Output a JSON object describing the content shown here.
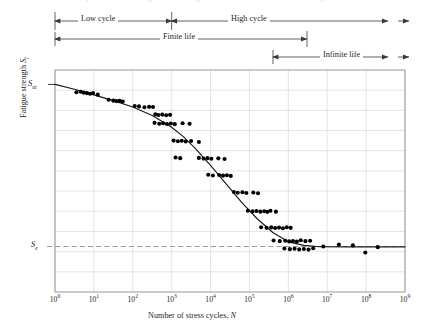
{
  "figure": {
    "kind": "s-n-fatigue-diagram",
    "background": "#ffffff",
    "ink": "#231f20",
    "grid_color": "#d7d9dc",
    "frame_color": "#8a8d91",
    "curve_color": "#1a1a1a",
    "point_color": "#000000",
    "dashed_color": "#9a9ca0"
  },
  "annotations": {
    "low_cycle": "Low cycle",
    "high_cycle": "High cycle",
    "finite_life": "Finite life",
    "infinite_life": "Infinite life"
  },
  "axes": {
    "x_title_prefix": "Number of stress cycles, ",
    "x_title_symbol": "N",
    "y_title_prefix": "Fatigue strength ",
    "y_title_symbol": "S",
    "y_title_sub": "f",
    "x_ticks": [
      "0",
      "1",
      "2",
      "3",
      "4",
      "5",
      "6",
      "7",
      "8",
      "9"
    ],
    "x_tick_mantissa": "10",
    "y_markers": [
      {
        "symbol": "S",
        "sub": "ut",
        "name": "ultimate-tensile-strength"
      },
      {
        "symbol": "S",
        "sub": "e",
        "name": "endurance-limit"
      }
    ]
  },
  "chart_data": {
    "type": "scatter",
    "title": "",
    "xlabel": "Number of stress cycles, N",
    "ylabel": "Fatigue strength S_f",
    "x_scale": "log10",
    "xlim": [
      0,
      9
    ],
    "ylim": [
      0,
      1
    ],
    "grid": true,
    "legend": null,
    "y_reference_lines": [
      {
        "label": "S_ut",
        "value": 0.935,
        "style": "solid-tick"
      },
      {
        "label": "S_e",
        "value": 0.205,
        "style": "dashed"
      }
    ],
    "region_brackets": [
      {
        "label": "Low cycle",
        "x_from": 0,
        "x_to": 3,
        "row": 0
      },
      {
        "label": "High cycle",
        "x_from": 3,
        "x_to": 9,
        "row": 0,
        "open_end": true
      },
      {
        "label": "Finite life",
        "x_from": 0,
        "x_to": 6.5,
        "row": 1
      },
      {
        "label": "Infinite life",
        "x_from": 5.6,
        "x_to": 9,
        "row": 2,
        "open_end": true
      }
    ],
    "fit_curve": [
      [
        0.0,
        0.935
      ],
      [
        0.5,
        0.913
      ],
      [
        1.0,
        0.888
      ],
      [
        1.5,
        0.862
      ],
      [
        2.0,
        0.833
      ],
      [
        2.5,
        0.795
      ],
      [
        3.0,
        0.742
      ],
      [
        3.3,
        0.7
      ],
      [
        3.6,
        0.648
      ],
      [
        4.0,
        0.57
      ],
      [
        4.4,
        0.487
      ],
      [
        4.8,
        0.404
      ],
      [
        5.2,
        0.33
      ],
      [
        5.6,
        0.268
      ],
      [
        6.0,
        0.226
      ],
      [
        6.4,
        0.21
      ],
      [
        6.8,
        0.204
      ],
      [
        7.5,
        0.203
      ],
      [
        8.2,
        0.203
      ],
      [
        9.0,
        0.203
      ]
    ],
    "points": [
      [
        0.55,
        0.9
      ],
      [
        0.66,
        0.902
      ],
      [
        0.74,
        0.898
      ],
      [
        0.82,
        0.896
      ],
      [
        0.9,
        0.893
      ],
      [
        0.98,
        0.896
      ],
      [
        1.1,
        0.889
      ],
      [
        1.38,
        0.866
      ],
      [
        1.5,
        0.862
      ],
      [
        1.58,
        0.86
      ],
      [
        1.66,
        0.861
      ],
      [
        1.74,
        0.858
      ],
      [
        2.05,
        0.838
      ],
      [
        2.16,
        0.836
      ],
      [
        2.3,
        0.832
      ],
      [
        2.42,
        0.834
      ],
      [
        2.52,
        0.833
      ],
      [
        2.58,
        0.8
      ],
      [
        2.66,
        0.797
      ],
      [
        2.76,
        0.799
      ],
      [
        2.86,
        0.796
      ],
      [
        2.96,
        0.798
      ],
      [
        2.56,
        0.762
      ],
      [
        2.68,
        0.758
      ],
      [
        2.78,
        0.76
      ],
      [
        2.88,
        0.757
      ],
      [
        2.98,
        0.759
      ],
      [
        3.08,
        0.756
      ],
      [
        3.28,
        0.76
      ],
      [
        3.46,
        0.758
      ],
      [
        3.05,
        0.682
      ],
      [
        3.16,
        0.679
      ],
      [
        3.26,
        0.681
      ],
      [
        3.36,
        0.678
      ],
      [
        3.5,
        0.68
      ],
      [
        3.7,
        0.676
      ],
      [
        3.1,
        0.606
      ],
      [
        3.22,
        0.603
      ],
      [
        3.7,
        0.604
      ],
      [
        3.82,
        0.601
      ],
      [
        3.92,
        0.603
      ],
      [
        4.02,
        0.6
      ],
      [
        4.2,
        0.602
      ],
      [
        4.36,
        0.599
      ],
      [
        3.94,
        0.528
      ],
      [
        4.06,
        0.525
      ],
      [
        4.22,
        0.527
      ],
      [
        4.32,
        0.524
      ],
      [
        4.42,
        0.526
      ],
      [
        4.52,
        0.523
      ],
      [
        4.6,
        0.45
      ],
      [
        4.7,
        0.447
      ],
      [
        4.82,
        0.449
      ],
      [
        4.92,
        0.446
      ],
      [
        5.1,
        0.448
      ],
      [
        5.22,
        0.445
      ],
      [
        4.96,
        0.366
      ],
      [
        5.08,
        0.363
      ],
      [
        5.18,
        0.365
      ],
      [
        5.28,
        0.362
      ],
      [
        5.38,
        0.364
      ],
      [
        5.46,
        0.361
      ],
      [
        5.54,
        0.366
      ],
      [
        5.68,
        0.362
      ],
      [
        5.3,
        0.292
      ],
      [
        5.44,
        0.289
      ],
      [
        5.56,
        0.291
      ],
      [
        5.66,
        0.288
      ],
      [
        5.76,
        0.29
      ],
      [
        5.86,
        0.287
      ],
      [
        5.96,
        0.292
      ],
      [
        6.06,
        0.289
      ],
      [
        5.62,
        0.232
      ],
      [
        5.78,
        0.229
      ],
      [
        5.92,
        0.231
      ],
      [
        6.02,
        0.228
      ],
      [
        6.12,
        0.23
      ],
      [
        6.22,
        0.227
      ],
      [
        6.32,
        0.233
      ],
      [
        6.44,
        0.229
      ],
      [
        6.56,
        0.231
      ],
      [
        5.9,
        0.196
      ],
      [
        6.04,
        0.193
      ],
      [
        6.16,
        0.195
      ],
      [
        6.28,
        0.192
      ],
      [
        6.4,
        0.194
      ],
      [
        6.52,
        0.191
      ],
      [
        6.64,
        0.197
      ],
      [
        6.9,
        0.205
      ],
      [
        7.3,
        0.214
      ],
      [
        7.66,
        0.21
      ],
      [
        7.98,
        0.178
      ],
      [
        8.3,
        0.202
      ]
    ]
  }
}
